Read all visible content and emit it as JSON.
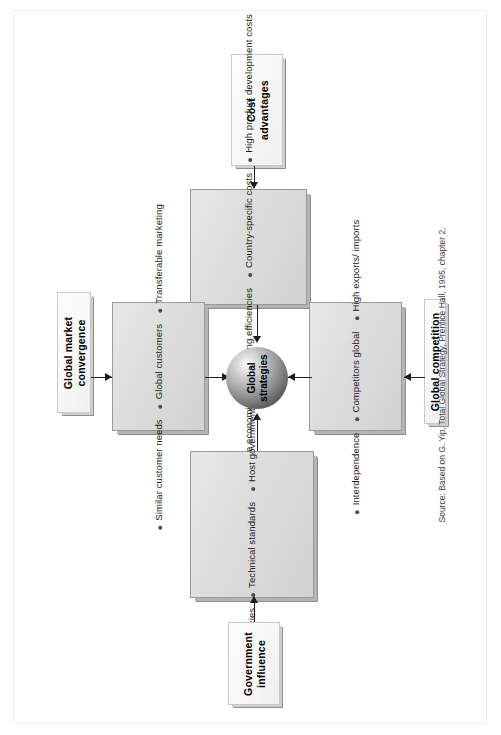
{
  "figure": {
    "center_node": {
      "label": "Global\nstrategies",
      "shape": "sphere"
    },
    "source_note": "Source: Based on G. Yip, Total Global Strategy, Prentice Hall, 1995, chapter 2.",
    "drivers": [
      {
        "id": "cost-advantages",
        "label": "Cost\nadvantages",
        "position": "top",
        "items": [
          "Scale economies",
          "Sourcing efficiencies",
          "Country-specific costs",
          "High product\ndevelopment costs"
        ]
      },
      {
        "id": "global-market-convergence",
        "label": "Global market\nconvergence",
        "position": "left",
        "items": [
          "Similar customer\nneeds",
          "Global customers",
          "Transferable\nmarketing"
        ]
      },
      {
        "id": "global-competition",
        "label": "Global competition",
        "position": "right",
        "items": [
          "Interdependence",
          "Competitors global",
          "High exports/\nimports"
        ]
      },
      {
        "id": "government-influence",
        "label": "Government\ninfluence",
        "position": "bottom",
        "items": [
          "Trade policies",
          "Technical standards",
          "Host government\npolicies"
        ]
      }
    ]
  },
  "colors": {
    "panel_fill": "#dcdcdc",
    "panel_border": "#9a9a9a",
    "label_fill": "#f8f8f8",
    "connector": "#1d1d1d",
    "sphere_light": "#e2e2e2",
    "sphere_dark": "#2a2a2a"
  }
}
